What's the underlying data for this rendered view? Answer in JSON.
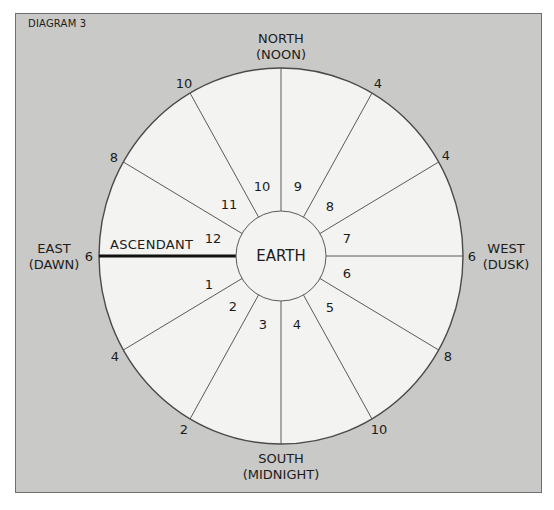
{
  "caption": "DIAGRAM 3",
  "directions": {
    "north": {
      "line1": "NORTH",
      "line2": "(NOON)"
    },
    "south": {
      "line1": "SOUTH",
      "line2": "(MIDNIGHT)"
    },
    "east": {
      "line1": "EAST",
      "line2": "(DAWN)"
    },
    "west": {
      "line1": "WEST",
      "line2": "(DUSK)"
    }
  },
  "center_label": "EARTH",
  "ascendant_label": "ASCENDANT",
  "houses": [
    "1",
    "2",
    "3",
    "4",
    "5",
    "6",
    "7",
    "8",
    "9",
    "10",
    "11",
    "12"
  ],
  "outer_hours": {
    "east": "6",
    "west": "6",
    "upper_left_1": "8",
    "upper_left_2": "10",
    "upper_right_1": "2",
    "upper_right_2": "4",
    "lower_left_1": "4",
    "lower_left_2": "2",
    "lower_right_1": "8",
    "lower_right_2": "10"
  },
  "colors": {
    "background": "#c9c9c7",
    "wheel_fill": "#f3f3f1",
    "line": "#5a5a5a",
    "ascendant_line": "#111111",
    "text": "#1c1c1c"
  }
}
